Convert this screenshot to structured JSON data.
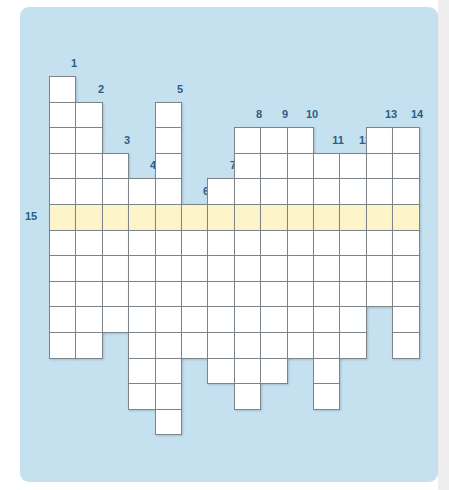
{
  "puzzle": {
    "type": "crossword-grid",
    "colors": {
      "panel_background": "#c5e1f0",
      "cell_background": "#ffffff",
      "highlight_row": "#fdf5c9",
      "clue_number": "#2a5f86",
      "grid_line": "#7d858a"
    },
    "grid": {
      "origin_x": 49,
      "origin_y": 76,
      "cell_w": 26.4,
      "cell_h": 25.6,
      "highlight_row_index": 5,
      "columns": [
        {
          "number": "1",
          "start_row": 0,
          "end_row": 10
        },
        {
          "number": "2",
          "start_row": 1,
          "end_row": 10
        },
        {
          "number": "3",
          "start_row": 3,
          "end_row": 9
        },
        {
          "number": "4",
          "start_row": 4,
          "end_row": 12
        },
        {
          "number": "5",
          "start_row": 1,
          "end_row": 13
        },
        {
          "number": "6",
          "start_row": 5,
          "end_row": 10
        },
        {
          "number": "7",
          "start_row": 4,
          "end_row": 11
        },
        {
          "number": "8",
          "start_row": 2,
          "end_row": 12
        },
        {
          "number": "9",
          "start_row": 2,
          "end_row": 11
        },
        {
          "number": "10",
          "start_row": 2,
          "end_row": 10
        },
        {
          "number": "11",
          "start_row": 3,
          "end_row": 12
        },
        {
          "number": "12",
          "start_row": 3,
          "end_row": 10
        },
        {
          "number": "13",
          "start_row": 2,
          "end_row": 8
        },
        {
          "number": "14",
          "start_row": 2,
          "end_row": 10
        }
      ],
      "across_clue": {
        "number": "15",
        "row": 5
      }
    }
  }
}
